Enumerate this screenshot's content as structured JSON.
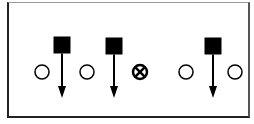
{
  "diagram": {
    "colors": {
      "ink": "#000000",
      "background": "#ffffff"
    },
    "elements": [
      {
        "type": "square",
        "label": "player-1",
        "x": 62,
        "y": 45,
        "size": 17,
        "arrow_to_y": 98
      },
      {
        "type": "square",
        "label": "player-2",
        "x": 114,
        "y": 46,
        "size": 17,
        "arrow_to_y": 98
      },
      {
        "type": "square",
        "label": "player-3",
        "x": 213,
        "y": 46,
        "size": 17,
        "arrow_to_y": 98
      },
      {
        "type": "circle",
        "label": "open-1",
        "x": 42,
        "y": 72,
        "r": 7
      },
      {
        "type": "circle",
        "label": "open-2",
        "x": 87,
        "y": 72,
        "r": 7
      },
      {
        "type": "circle-x",
        "label": "marked",
        "x": 140,
        "y": 72,
        "r": 7
      },
      {
        "type": "circle",
        "label": "open-3",
        "x": 186,
        "y": 72,
        "r": 7
      },
      {
        "type": "circle",
        "label": "open-4",
        "x": 235,
        "y": 72,
        "r": 7
      }
    ]
  }
}
